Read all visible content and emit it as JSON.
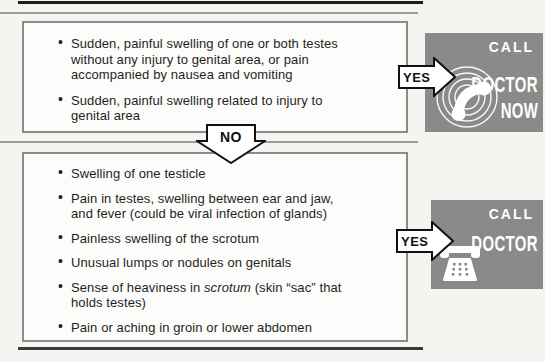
{
  "labels": {
    "yes": "YES",
    "no": "NO"
  },
  "box1": {
    "bullet1": "Sudden, painful swelling of one or both testes without any injury to genital area, or pain accompanied by nausea and vomiting",
    "bullet2": "Sudden, painful swelling related to injury to genital area"
  },
  "box2": {
    "bullet1": "Swelling of one testicle",
    "bullet2": "Pain in testes, swelling between ear and jaw, and fever (could be viral infection of glands)",
    "bullet3": "Painless swelling of the scrotum",
    "bullet4": "Unusual lumps or nodules on genitals",
    "bullet5_before": "Sense of heaviness in ",
    "bullet5_italic": "scrotum",
    "bullet5_after": " (skin “sac” that holds testes)",
    "bullet6": "Pain or aching in groin or lower abdomen"
  },
  "badge_call_doctor_now": {
    "call": "CALL",
    "doctor": "DOCTOR",
    "now": "NOW"
  },
  "badge_call_doctor": {
    "call": "CALL",
    "doctor": "DOCTOR"
  },
  "colors": {
    "badge_background": "#8a8a8a",
    "box_border": "#8b8b8b",
    "rule_dark": "#1d1d1d",
    "rule_gray": "#9b9b9b",
    "paper": "#f5f4f1",
    "badge_text": "#ffffff"
  }
}
